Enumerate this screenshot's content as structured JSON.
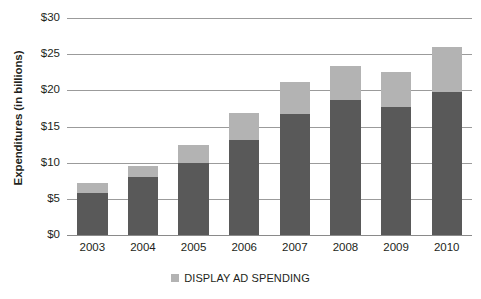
{
  "chart_data": {
    "type": "bar",
    "stacked": true,
    "title": "",
    "xlabel": "",
    "ylabel": "Expenditures (in billions)",
    "categories": [
      "2003",
      "2004",
      "2005",
      "2006",
      "2007",
      "2008",
      "2009",
      "2010"
    ],
    "series": [
      {
        "name": "BASE SPENDING",
        "color": "#595959",
        "values": [
          5.8,
          8.0,
          10.0,
          13.1,
          16.7,
          18.6,
          17.7,
          19.8
        ]
      },
      {
        "name": "DISPLAY AD SPENDING",
        "color": "#b3b3b3",
        "values": [
          1.4,
          1.5,
          2.5,
          3.8,
          4.5,
          4.7,
          4.9,
          6.2
        ]
      }
    ],
    "totals": [
      7.2,
      9.5,
      12.5,
      16.9,
      21.2,
      23.3,
      22.6,
      26.0
    ],
    "ylim": [
      0,
      30
    ],
    "ytick_values": [
      0,
      5,
      10,
      15,
      20,
      25,
      30
    ],
    "ytick_labels": [
      "$0",
      "$5",
      "$10",
      "$15",
      "$20",
      "$25",
      "$30"
    ],
    "grid": true,
    "legend_position": "bottom",
    "legend_entries": [
      {
        "label": "DISPLAY AD SPENDING",
        "color": "#b3b3b3",
        "marker": "square"
      }
    ]
  },
  "colors": {
    "dark_gray": "#595959",
    "light_gray": "#b3b3b3",
    "gridline": "#9b9b9b",
    "text": "#231f20",
    "background": "#ffffff"
  }
}
